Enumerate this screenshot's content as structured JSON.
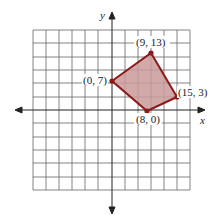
{
  "figure": {
    "axis_labels": {
      "x": "x",
      "y": "y"
    },
    "vertices": [
      {
        "label": "(0, 7)",
        "x": 0,
        "y": 7
      },
      {
        "label": "(9, 13)",
        "x": 9,
        "y": 13
      },
      {
        "label": "(15, 3)",
        "x": 15,
        "y": 3
      },
      {
        "label": "(8, 0)",
        "x": 8,
        "y": 0
      }
    ],
    "colors": {
      "grid": "#555555",
      "polygon_stroke": "#8b1a1a",
      "polygon_fill": "#c99a9a",
      "vertex": "#8b1a1a"
    }
  }
}
